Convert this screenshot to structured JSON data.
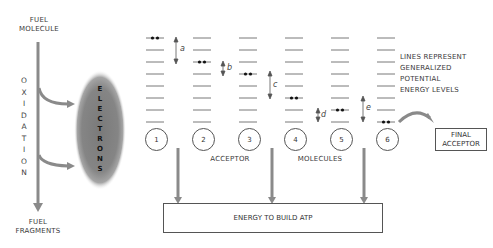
{
  "left": {
    "fuel_molecule": [
      "FUEL",
      "MOLECULE"
    ],
    "oxidation": [
      "O",
      "X",
      "I",
      "D",
      "A",
      "T",
      "I",
      "O",
      "N"
    ],
    "fuel_fragments": [
      "FUEL",
      "FRAGMENTS"
    ],
    "electrons": [
      "E",
      "L",
      "E",
      "C",
      "T",
      "R",
      "O",
      "N",
      "S"
    ]
  },
  "acceptors": {
    "numbers": [
      "1",
      "2",
      "3",
      "4",
      "5",
      "6"
    ],
    "electron_levels": [
      0,
      2,
      3,
      5,
      6,
      7
    ],
    "energy_drops": [
      "a",
      "b",
      "c",
      "d",
      "e"
    ],
    "label_acceptor": "ACCEPTOR",
    "label_molecules": "MOLECULES"
  },
  "legend": {
    "lines": [
      "LINES REPRESENT",
      "GENERALIZED",
      "POTENTIAL",
      "ENERGY LEVELS"
    ]
  },
  "final_acceptor": [
    "FINAL",
    "ACCEPTOR"
  ],
  "atp_box": "ENERGY TO BUILD ATP",
  "colors": {
    "arrow": "#8a8a8a",
    "electron_cloud": "#7d7d7d",
    "line": "#555555"
  }
}
